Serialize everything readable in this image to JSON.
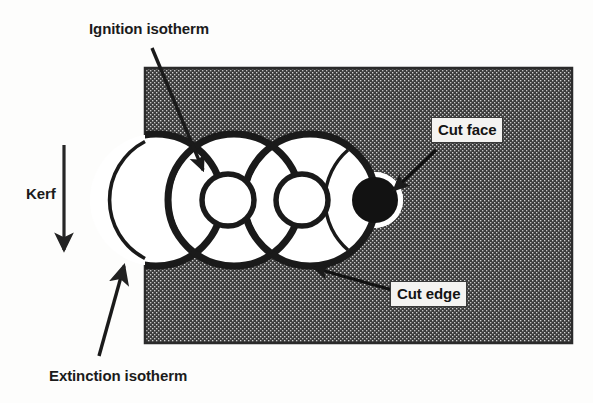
{
  "figure": {
    "colors": {
      "material_fill": "#3b3b3b",
      "material_speckle_light": "#cfcfcf",
      "outline": "#1a1a1a",
      "kerf_white": "#ffffff",
      "cut_face_fill": "#121212",
      "label_box_fill": "#f4f3f1",
      "page_background": "#fdfdfc"
    },
    "labels": {
      "ignition_isotherm": "Ignition isotherm",
      "extinction_isotherm": "Extinction isotherm",
      "kerf": "Kerf",
      "cut_face": "Cut face",
      "cut_edge": "Cut edge"
    },
    "geometry": {
      "material_rect": {
        "x": 145,
        "y": 68,
        "width": 427,
        "height": 275
      },
      "extinction_circles": [
        {
          "cx": 156,
          "cy": 200,
          "r": 66
        },
        {
          "cx": 234,
          "cy": 200,
          "r": 66
        },
        {
          "cx": 310,
          "cy": 200,
          "r": 66
        }
      ],
      "ignition_circles": [
        {
          "cx": 228,
          "cy": 200,
          "r": 26,
          "filled": false
        },
        {
          "cx": 302,
          "cy": 200,
          "r": 26,
          "filled": false
        },
        {
          "cx": 375,
          "cy": 200,
          "r": 22,
          "filled": true
        }
      ],
      "kerf_arrow": {
        "x": 64,
        "y1": 145,
        "y2": 256
      }
    }
  }
}
